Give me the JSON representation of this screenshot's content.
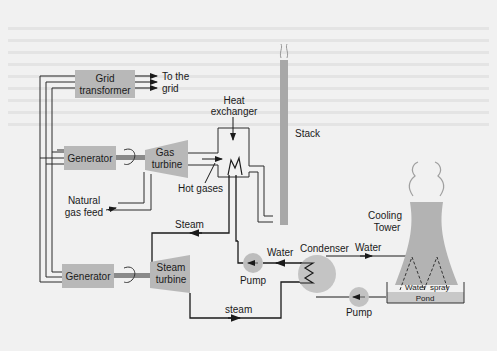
{
  "colors": {
    "background": "#f1f1f1",
    "component_fill": "#b5b5b5",
    "line": "#2a2a2a",
    "text": "#1a1a1a"
  },
  "components": {
    "grid_transformer": {
      "line1": "Grid",
      "line2": "transformer"
    },
    "to_grid": {
      "line1": "To the",
      "line2": "grid"
    },
    "generator_top": {
      "label": "Generator"
    },
    "generator_bottom": {
      "label": "Generator"
    },
    "gas_turbine": {
      "line1": "Gas",
      "line2": "turbine"
    },
    "steam_turbine": {
      "line1": "Steam",
      "line2": "turbine"
    },
    "heat_exchanger": {
      "line1": "Heat",
      "line2": "exchanger"
    },
    "stack": {
      "label": "Stack"
    },
    "natural_gas_feed": {
      "line1": "Natural",
      "line2": "gas feed"
    },
    "hot_gases": {
      "label": "Hot gases"
    },
    "cooling_tower": {
      "line1": "Cooling",
      "line2": "Tower"
    },
    "condenser": {
      "label": "Condenser"
    },
    "pump_left": {
      "label": "Pump"
    },
    "pump_right": {
      "label": "Pump"
    },
    "pond": {
      "label": "Pond"
    },
    "water_spray_1": {
      "label": "Water"
    },
    "water_spray_2": {
      "label": "spray"
    }
  },
  "flows": {
    "steam_upper": "Steam",
    "steam_lower": "steam",
    "water_left": "Water",
    "water_right": "Water"
  }
}
